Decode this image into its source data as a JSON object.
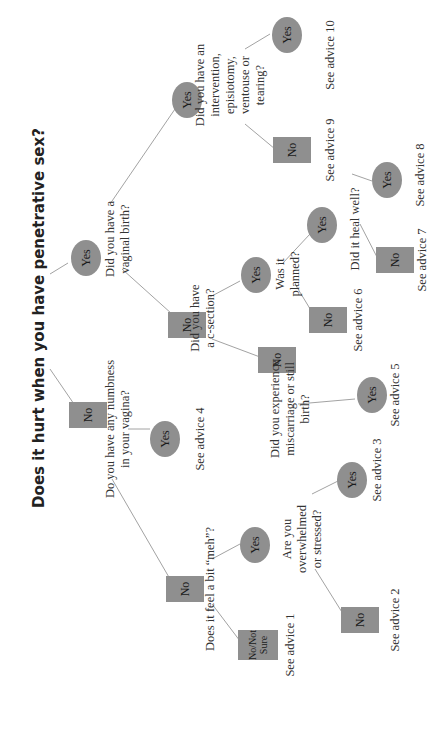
{
  "title": "Does it hurt when you have penetrative sex?",
  "colors": {
    "node_fill": "#8f8f8f",
    "line": "#888888",
    "text": "#333333"
  },
  "nodes": {
    "root_no": "No",
    "root_yes": "Yes",
    "numb_yes": "Yes",
    "numb_no": "No",
    "meh_notsure": "No/Not\nSure",
    "meh_yes": "Yes",
    "stress_no": "No",
    "stress_yes": "Yes",
    "vag_no": "No",
    "vag_yes": "Yes",
    "csec_no": "No",
    "csec_yes": "Yes",
    "misc_yes": "Yes",
    "plan_no": "No",
    "plan_yes": "Yes",
    "heal_no": "No",
    "heal_yes": "Yes",
    "int_no": "No",
    "int_yes": "Yes"
  },
  "questions": {
    "numbness": "Do you have any numbness\nin your vagina?",
    "vaginal_birth": "Did you have a\nvaginal birth?",
    "meh": "Does it feel a bit “meh”?",
    "overwhelmed": "Are you\noverwhelmed\nor stressed?",
    "csection": "Did you have\na c-section?",
    "miscarriage": "Did you experience\nmiscarriage or still\nbirth?",
    "planned": "Was it\nplanned?",
    "heal": "Did it heal well?",
    "intervention": "Did you have an\nintervention, episiotomy,\nventouse or tearing?"
  },
  "advice": {
    "a1": "See advice 1",
    "a2": "See advice 2",
    "a3": "See advice 3",
    "a4": "See advice 4",
    "a5": "See advice 5",
    "a6": "See advice 6",
    "a7": "See advice 7",
    "a8": "See advice 8",
    "a9": "See advice 9",
    "a10": "See advice 10"
  }
}
